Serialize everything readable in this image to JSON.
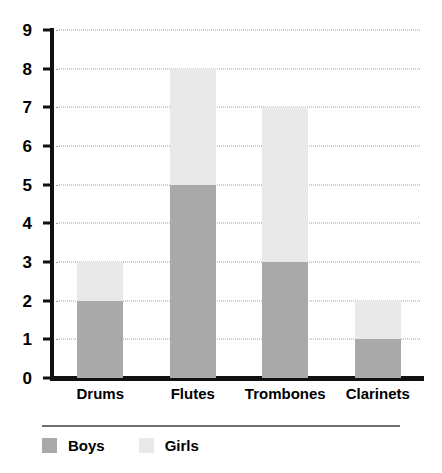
{
  "chart_data": {
    "type": "bar",
    "subtype": "stacked-bar",
    "title": "",
    "xlabel": "",
    "ylabel": "",
    "categories": [
      "Drums",
      "Flutes",
      "Trombones",
      "Clarinets"
    ],
    "series": [
      {
        "name": "Boys",
        "color": "#a9a9a9",
        "values": [
          2,
          5,
          3,
          1
        ]
      },
      {
        "name": "Girls",
        "color": "#e9e9e9",
        "values": [
          1,
          3,
          4,
          1
        ]
      }
    ],
    "totals": [
      3,
      8,
      7,
      2
    ],
    "ylim": [
      0,
      9
    ],
    "ytick_labels": [
      "0",
      "1",
      "2",
      "3",
      "4",
      "5",
      "6",
      "7",
      "8",
      "9"
    ],
    "ytick_values": [
      0,
      1,
      2,
      3,
      4,
      5,
      6,
      7,
      8,
      9
    ],
    "grid": true,
    "grid_style": "dotted",
    "grid_color": "#9a9aba",
    "legend_position": "bottom",
    "axis_color": "#111111",
    "background": "#ffffff"
  }
}
